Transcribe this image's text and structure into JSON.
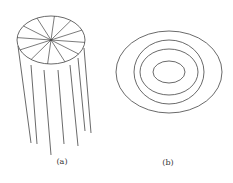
{
  "figure": {
    "panels": [
      {
        "id": "a",
        "label": "(a)",
        "description": "Cylinder-like bundle: top ellipse divided into sectors by radial lines, with vertical lines hanging down",
        "ellipse": {
          "cx": 51,
          "cy": 40,
          "rx": 34,
          "ry": 24
        },
        "spokes": 12,
        "hanging_lines": [
          {
            "x1": 18,
            "y1": 46,
            "x2": 31,
            "y2": 143
          },
          {
            "x1": 31,
            "y1": 65,
            "x2": 37,
            "y2": 144
          },
          {
            "x1": 44,
            "y1": 70,
            "x2": 51,
            "y2": 155
          },
          {
            "x1": 58,
            "y1": 70,
            "x2": 64,
            "y2": 144
          },
          {
            "x1": 70,
            "y1": 65,
            "x2": 78,
            "y2": 146
          },
          {
            "x1": 78,
            "y1": 58,
            "x2": 85,
            "y2": 131
          },
          {
            "x1": 84,
            "y1": 48,
            "x2": 91,
            "y2": 133
          }
        ]
      },
      {
        "id": "b",
        "label": "(b)",
        "description": "Concentric ellipses",
        "center": {
          "cx": 169,
          "cy": 72
        },
        "ellipses": [
          {
            "rx": 53,
            "ry": 41
          },
          {
            "rx": 35,
            "ry": 32
          },
          {
            "rx": 29,
            "ry": 23
          },
          {
            "rx": 16,
            "ry": 11
          }
        ]
      }
    ],
    "stroke_color": "#444444"
  }
}
